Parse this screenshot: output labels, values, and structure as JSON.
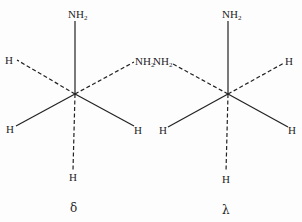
{
  "figure": {
    "conformers": [
      {
        "id": "delta",
        "label": "δ",
        "center": [
          75,
          94
        ],
        "substituents": {
          "top": "NH",
          "top_sub": "2",
          "upper_left": "H",
          "upper_right": "NH",
          "upper_right_sub": "2",
          "lower_left": "H",
          "lower_right": "H",
          "bottom": "H"
        },
        "bond_styles": {
          "top": "solid",
          "upper_left": "dashed",
          "upper_right": "dashed",
          "lower_left": "solid",
          "lower_right": "solid",
          "bottom": "dashed"
        }
      },
      {
        "id": "lambda",
        "label": "λ",
        "center": [
          228,
          94
        ],
        "substituents": {
          "top": "NH",
          "top_sub": "2",
          "upper_left": "NH",
          "upper_left_sub": "2",
          "upper_right": "H",
          "lower_left": "H",
          "lower_right": "H",
          "bottom": "H"
        },
        "bond_styles": {
          "top": "solid",
          "upper_left": "dashed",
          "upper_right": "dashed",
          "lower_left": "solid",
          "lower_right": "solid",
          "bottom": "dashed"
        }
      }
    ],
    "colors": {
      "ink": "#222222",
      "background": "#fdfdfd"
    }
  }
}
